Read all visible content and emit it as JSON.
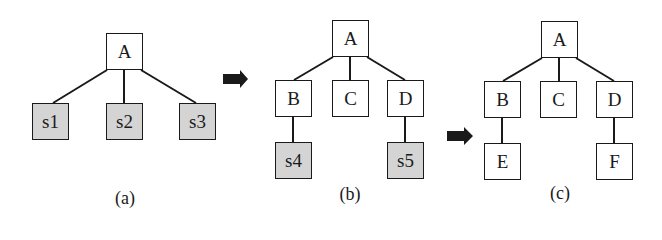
{
  "diagram": {
    "panels": [
      {
        "caption": "(a)",
        "nodes": [
          {
            "id": "A",
            "label": "A",
            "shaded": false
          },
          {
            "id": "s1",
            "label": "s1",
            "shaded": true
          },
          {
            "id": "s2",
            "label": "s2",
            "shaded": true
          },
          {
            "id": "s3",
            "label": "s3",
            "shaded": true
          }
        ],
        "edges": [
          [
            "A",
            "s1"
          ],
          [
            "A",
            "s2"
          ],
          [
            "A",
            "s3"
          ]
        ]
      },
      {
        "caption": "(b)",
        "nodes": [
          {
            "id": "A",
            "label": "A",
            "shaded": false
          },
          {
            "id": "B",
            "label": "B",
            "shaded": false
          },
          {
            "id": "C",
            "label": "C",
            "shaded": false
          },
          {
            "id": "D",
            "label": "D",
            "shaded": false
          },
          {
            "id": "s4",
            "label": "s4",
            "shaded": true
          },
          {
            "id": "s5",
            "label": "s5",
            "shaded": true
          }
        ],
        "edges": [
          [
            "A",
            "B"
          ],
          [
            "A",
            "C"
          ],
          [
            "A",
            "D"
          ],
          [
            "B",
            "s4"
          ],
          [
            "D",
            "s5"
          ]
        ]
      },
      {
        "caption": "(c)",
        "nodes": [
          {
            "id": "A",
            "label": "A",
            "shaded": false
          },
          {
            "id": "B",
            "label": "B",
            "shaded": false
          },
          {
            "id": "C",
            "label": "C",
            "shaded": false
          },
          {
            "id": "D",
            "label": "D",
            "shaded": false
          },
          {
            "id": "E",
            "label": "E",
            "shaded": false
          },
          {
            "id": "F",
            "label": "F",
            "shaded": false
          }
        ],
        "edges": [
          [
            "A",
            "B"
          ],
          [
            "A",
            "C"
          ],
          [
            "A",
            "D"
          ],
          [
            "B",
            "E"
          ],
          [
            "D",
            "F"
          ]
        ]
      }
    ],
    "arrows": [
      "arrow-right-icon",
      "arrow-right-icon"
    ],
    "colors": {
      "stroke": "#1a1a1a",
      "shaded_fill": "#d4d4d4",
      "arrow": "#1a1a1a"
    }
  }
}
